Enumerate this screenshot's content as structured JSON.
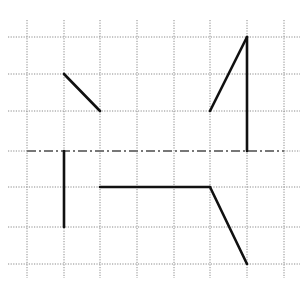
{
  "diagram": {
    "type": "grid-symmetry-drawing",
    "grid": {
      "columns_x": [
        27,
        64,
        100,
        137,
        174,
        210,
        247,
        284
      ],
      "rows_y": [
        37,
        74,
        111,
        151,
        187,
        227,
        264
      ],
      "line_color": "#8a8a8a",
      "extent": {
        "x0": 8,
        "x1": 300,
        "y0": 20,
        "y1": 278
      }
    },
    "axis": {
      "style": "dash-dot",
      "y": 151,
      "x0": 27,
      "x1": 284,
      "color": "#777777"
    },
    "segments": [
      {
        "id": "upper-left-diagonal",
        "x1": 64,
        "y1": 74,
        "x2": 100,
        "y2": 111
      },
      {
        "id": "upper-right-diagonal",
        "x1": 210,
        "y1": 111,
        "x2": 247,
        "y2": 37
      },
      {
        "id": "upper-right-vertical",
        "x1": 247,
        "y1": 37,
        "x2": 247,
        "y2": 151
      },
      {
        "id": "lower-left-vertical",
        "x1": 64,
        "y1": 151,
        "x2": 64,
        "y2": 227
      },
      {
        "id": "lower-horizontal",
        "x1": 100,
        "y1": 187,
        "x2": 210,
        "y2": 187
      },
      {
        "id": "lower-right-diagonal",
        "x1": 210,
        "y1": 187,
        "x2": 247,
        "y2": 264
      }
    ],
    "stroke_color": "#111111"
  }
}
